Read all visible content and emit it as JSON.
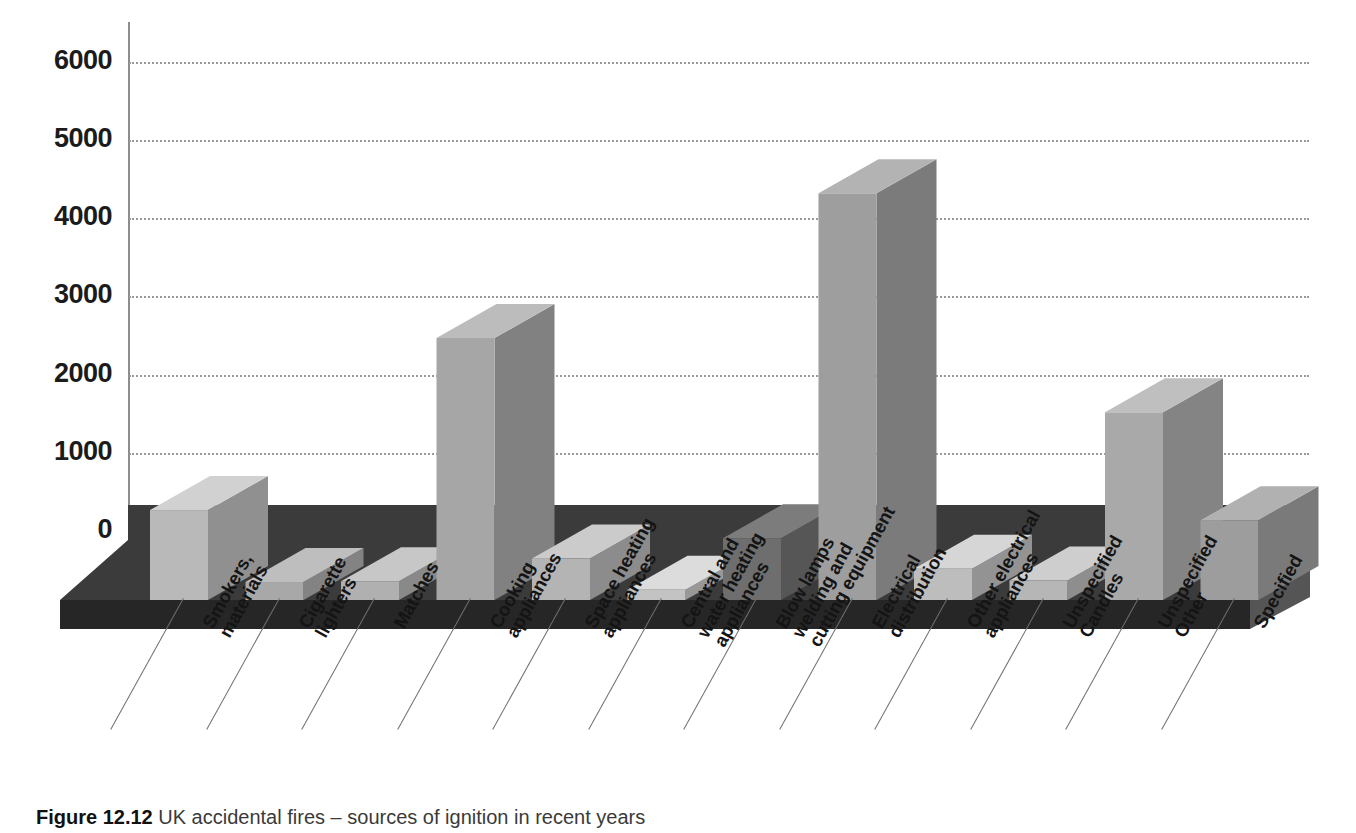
{
  "figure": {
    "number_label": "Figure 12.12",
    "caption": "UK accidental fires – sources of ignition in recent years"
  },
  "chart_data": {
    "type": "bar",
    "title": "",
    "subtitle": "",
    "xlabel": "",
    "ylabel": "",
    "ylim": [
      0,
      6000
    ],
    "ytick_labels": [
      "0",
      "1000",
      "2000",
      "3000",
      "4000",
      "5000",
      "6000"
    ],
    "ytick_values": [
      0,
      1000,
      2000,
      3000,
      4000,
      5000,
      6000
    ],
    "grid": "horizontal-dotted",
    "legend": "none",
    "style": "3d-isometric-bars-grayscale",
    "categories": [
      "Smokers,\nmaterials",
      "Cigarette\nlighters",
      "Matches",
      "Cooking\nappliances",
      "Space heating\nappliances",
      "Central and\nwater heating\nappliances",
      "Blow lamps\nwelding and\ncutting equipment",
      "Electrical\ndistribution",
      "Other electrical\nappliances",
      "Unspecified\nCandles",
      "Unspecified\nOther",
      "Specified"
    ],
    "values": [
      1150,
      230,
      240,
      3350,
      530,
      130,
      790,
      5200,
      400,
      250,
      2400,
      1020
    ],
    "bar_colors": [
      "#b9b9b9",
      "#a8a8a8",
      "#b0b0b0",
      "#a6a6a6",
      "#b4b4b4",
      "#c3c3c3",
      "#6e6e6e",
      "#9e9e9e",
      "#bdbdbd",
      "#b6b6b6",
      "#a9a9a9",
      "#9d9d9d"
    ]
  },
  "colors": {
    "background": "#ffffff",
    "axis": "#8d8d8d",
    "gridline": "#9a9a9a",
    "floor_top": "#3a3a3a",
    "floor_front": "#2a2a2a",
    "tick_text": "#1b1b1b",
    "label_text": "#141414"
  }
}
